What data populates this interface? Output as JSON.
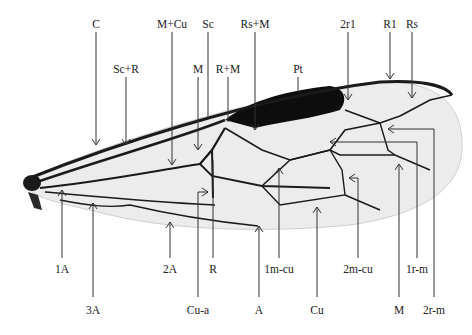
{
  "diagram": {
    "colors": {
      "vein": "#1a1a1a",
      "membrane": "#ececec",
      "pterostigma": "#0d0d0d",
      "leader": "#333333"
    },
    "top_labels": [
      {
        "text": "C",
        "x": 96,
        "y": 19
      },
      {
        "text": "M+Cu",
        "x": 172,
        "y": 19
      },
      {
        "text": "Sc",
        "x": 208,
        "y": 19
      },
      {
        "text": "Rs+M",
        "x": 255,
        "y": 19
      },
      {
        "text": "2r1",
        "x": 348,
        "y": 19
      },
      {
        "text": "R1",
        "x": 390,
        "y": 19
      },
      {
        "text": "Rs",
        "x": 412,
        "y": 19
      }
    ],
    "mid_labels": [
      {
        "text": "Sc+R",
        "x": 126,
        "y": 64
      },
      {
        "text": "M",
        "x": 198,
        "y": 64
      },
      {
        "text": "R+M",
        "x": 228,
        "y": 64
      },
      {
        "text": "Pt",
        "x": 298,
        "y": 64
      }
    ],
    "lower_labels": [
      {
        "text": "1A",
        "x": 62,
        "y": 264
      },
      {
        "text": "2A",
        "x": 170,
        "y": 264
      },
      {
        "text": "R",
        "x": 213,
        "y": 264
      },
      {
        "text": "1m-cu",
        "x": 279,
        "y": 264
      },
      {
        "text": "2m-cu",
        "x": 358,
        "y": 264
      },
      {
        "text": "1r-m",
        "x": 417,
        "y": 264
      }
    ],
    "bottom_labels": [
      {
        "text": "3A",
        "x": 93,
        "y": 305
      },
      {
        "text": "Cu-a",
        "x": 198,
        "y": 305
      },
      {
        "text": "A",
        "x": 259,
        "y": 305
      },
      {
        "text": "Cu",
        "x": 317,
        "y": 305
      },
      {
        "text": "M",
        "x": 399,
        "y": 305
      },
      {
        "text": "2r-m",
        "x": 434,
        "y": 305
      }
    ]
  }
}
